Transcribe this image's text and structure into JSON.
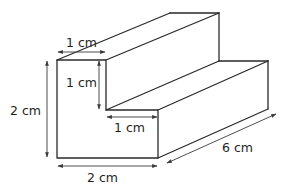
{
  "diagram": {
    "type": "3d-prism-L-shaped-step",
    "colors": {
      "edge": "#2a2a2a",
      "dimension_line": "#3a3a3a",
      "text": "#1e1e1e",
      "background": "#ffffff"
    },
    "labels": {
      "top_width": "1 cm",
      "upper_height": "1 cm",
      "step_width": "1 cm",
      "total_height": "2 cm",
      "bottom_width": "2 cm",
      "length": "6 cm"
    }
  }
}
